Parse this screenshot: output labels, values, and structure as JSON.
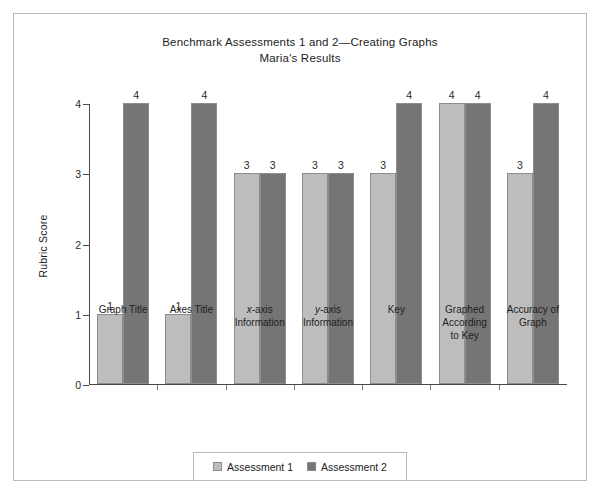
{
  "figure": {
    "title_line1": "Benchmark Assessments 1 and 2—Creating Graphs",
    "title_line2": "Maria's Results"
  },
  "chart_data": {
    "type": "bar",
    "title": "Benchmark Assessments 1 and 2—Creating Graphs\nMaria's Results",
    "xlabel": "",
    "ylabel": "Rubric Score",
    "ylim": [
      0,
      4
    ],
    "yticks": [
      "0",
      "1",
      "2",
      "3",
      "4"
    ],
    "grid": false,
    "legend_position": "bottom-center",
    "categories": [
      "Graph Title",
      "Axes Title",
      "x-axis Information",
      "y-axis Information",
      "Key",
      "Graphed According to Key",
      "Accuracy of Graph"
    ],
    "category_lines": [
      [
        "Graph Title"
      ],
      [
        "Axes Title"
      ],
      [
        "x-axis",
        "Information"
      ],
      [
        "y-axis",
        "Information"
      ],
      [
        "Key"
      ],
      [
        "Graphed",
        "According",
        "to Key"
      ],
      [
        "Accuracy of",
        "Graph"
      ]
    ],
    "series": [
      {
        "name": "Assessment 1",
        "color": "#bdbdbd",
        "values": [
          1,
          1,
          3,
          3,
          3,
          4,
          3
        ]
      },
      {
        "name": "Assessment 2",
        "color": "#757575",
        "values": [
          4,
          4,
          3,
          3,
          4,
          4,
          4
        ]
      }
    ],
    "bar_labels": {
      "assessment_1": [
        "1",
        "1",
        "3",
        "3",
        "3",
        "4",
        "3"
      ],
      "assessment_2": [
        "4",
        "4",
        "3",
        "3",
        "4",
        "4",
        "4"
      ]
    }
  },
  "legend": {
    "items": [
      {
        "label": "Assessment 1",
        "color": "#bdbdbd"
      },
      {
        "label": "Assessment 2",
        "color": "#757575"
      }
    ]
  },
  "colors": {
    "series_1": "#bdbdbd",
    "series_2": "#757575",
    "bar_border": "#8d8d8d",
    "axis": "#4a4a4a",
    "frame": "#b9b9b9",
    "text": "#1d1d1d"
  }
}
